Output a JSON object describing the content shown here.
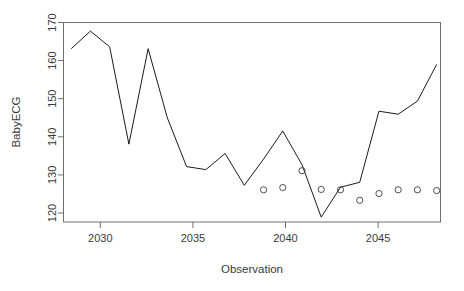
{
  "chart_data": {
    "type": "line",
    "title": "",
    "xlabel": "Observation",
    "ylabel": "BabyECG",
    "xlim": [
      2028.6,
      2048.2
    ],
    "ylim": [
      118.2,
      171.5
    ],
    "xticks": [
      2030,
      2035,
      2040,
      2045
    ],
    "xticklabels": [
      "2030",
      "2035",
      "2040",
      "2045"
    ],
    "yticks": [
      120,
      130,
      140,
      150,
      160,
      170
    ],
    "yticklabels": [
      "120",
      "130",
      "140",
      "150",
      "160",
      "170"
    ],
    "grid": false,
    "legend": null,
    "box": "full",
    "series": [
      {
        "name": "BabyECG",
        "kind": "line",
        "color": "#000000",
        "x": [
          2029,
          2030,
          2031,
          2032,
          2033,
          2034,
          2035,
          2036,
          2037,
          2038,
          2039,
          2040,
          2041,
          2042,
          2043,
          2044,
          2045,
          2046,
          2047,
          2048
        ],
        "values": [
          164.5,
          169.2,
          165.0,
          139.0,
          164.5,
          146.0,
          133.0,
          132.2,
          136.5,
          128.0,
          135.0,
          142.5,
          133.5,
          119.5,
          127.5,
          128.8,
          147.8,
          147.0,
          150.5,
          160.3
        ]
      },
      {
        "name": "markers",
        "kind": "scatter",
        "color": "#3a3a3a",
        "marker": "open-circle",
        "x": [
          2039,
          2040,
          2041,
          2042,
          2043,
          2044,
          2045,
          2046,
          2047,
          2048
        ],
        "values": [
          126.8,
          127.4,
          131.9,
          126.9,
          126.8,
          124.0,
          125.8,
          126.8,
          126.8,
          126.6
        ]
      }
    ]
  },
  "axes": {
    "ylabel": "BabyECG",
    "xlabel": "Observation"
  }
}
